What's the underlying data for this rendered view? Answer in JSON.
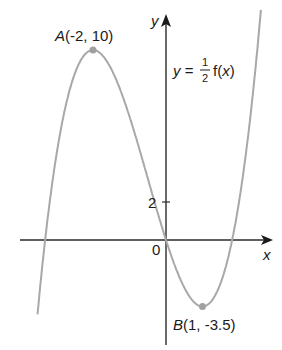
{
  "figure": {
    "function_label": {
      "prefix": "y = ",
      "frac_num": "1",
      "frac_den": "2",
      "suffix": "f(x)"
    },
    "axes": {
      "x_label": "x",
      "y_label": "y",
      "origin_label": "0",
      "y_tick_label": "2"
    },
    "points": [
      {
        "name": "A",
        "label": "A(-2, 10)",
        "x": -2,
        "y": 10
      },
      {
        "name": "B",
        "label": "B(1, -3.5)",
        "x": 1,
        "y": -3.5
      }
    ],
    "colors": {
      "curve": "#a8a8a8",
      "axes": "#2a2a2a",
      "point": "#a0a0a0",
      "text": "#1a1a1a"
    }
  },
  "chart_data": {
    "type": "line",
    "title": "",
    "xlabel": "x",
    "ylabel": "y",
    "equation_label": "y = 1/2 f(x)",
    "series": [
      {
        "name": "y = 1/2 f(x)",
        "x": [
          -3.5,
          -3,
          -2.5,
          -2,
          -1.5,
          -1,
          -0.5,
          0,
          0.5,
          1,
          1.5,
          2,
          2.5,
          2.6
        ],
        "values": [
          -3.5,
          4.5,
          8.75,
          10,
          8.625,
          5.5,
          2.375,
          0,
          -2.5,
          -3.5,
          -2.25,
          2,
          9.125,
          12.1
        ]
      }
    ],
    "annotations": [
      {
        "text": "A(-2, 10)",
        "x": -2,
        "y": 10
      },
      {
        "text": "B(1, -3.5)",
        "x": 1,
        "y": -3.5
      },
      {
        "text": "0",
        "x": 0,
        "y": 0
      },
      {
        "text": "2",
        "x": 0,
        "y": 2
      }
    ],
    "xlim": [
      -4,
      2.9
    ],
    "ylim": [
      -5.8,
      12.6
    ],
    "grid": false
  }
}
